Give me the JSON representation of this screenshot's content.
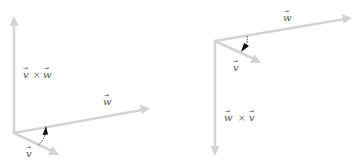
{
  "figure": {
    "colors": {
      "vector": "#d4d4d4",
      "rotation_arrow": "#111111",
      "label": "#555555"
    }
  },
  "left_panel": {
    "labels": {
      "cross": {
        "a": "v",
        "op": "×",
        "b": "w"
      },
      "w": "w",
      "v": "v"
    },
    "rotation": "v-to-w (counterclockwise)"
  },
  "right_panel": {
    "labels": {
      "cross": {
        "a": "w",
        "op": "×",
        "b": "v"
      },
      "w": "w",
      "v": "v"
    },
    "rotation": "w-to-v (clockwise)"
  },
  "vector_arrow_glyph": "→"
}
